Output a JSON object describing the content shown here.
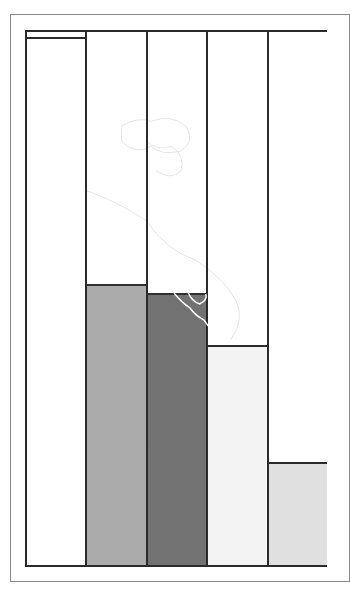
{
  "chart_data": {
    "type": "bar",
    "title": "",
    "xlabel": "",
    "ylabel": "",
    "categories": [
      "Bar 1",
      "Bar 2",
      "Bar 3",
      "Bar 4",
      "Bar 5"
    ],
    "values": [
      99,
      52.7,
      51.0,
      41.3,
      19.4
    ],
    "value_unit": "percent of plot height (no axis ticks shown)",
    "ylim": [
      0,
      100
    ],
    "grid": false,
    "legend": null,
    "colors": [
      "#ffffff",
      "#a9a9a9",
      "#6e6e6e",
      "#f3f3f3",
      "#e0e0e0"
    ],
    "background_watermark": "faint map outline of the Americas"
  },
  "colors": {
    "border": "#2a2a2a",
    "frame": "#8a8a8a",
    "background": "#ffffff"
  }
}
